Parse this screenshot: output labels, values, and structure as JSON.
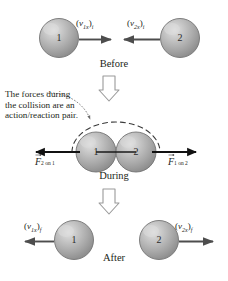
{
  "figure": {
    "panels": [
      {
        "key": "before",
        "label": "Before"
      },
      {
        "key": "during",
        "label": "During"
      },
      {
        "key": "after",
        "label": "After"
      }
    ]
  },
  "before": {
    "label": "Before",
    "ball_left": {
      "number": "1"
    },
    "ball_right": {
      "number": "2"
    },
    "velocity_left": {
      "open": "(",
      "v": "v",
      "sub": "1x",
      "close": ")",
      "outsub": "i",
      "direction": "right"
    },
    "velocity_right": {
      "open": "(",
      "v": "v",
      "sub": "2x",
      "close": ")",
      "outsub": "i",
      "direction": "left"
    }
  },
  "during": {
    "label": "During",
    "ball_left": {
      "number": "1"
    },
    "ball_right": {
      "number": "2"
    },
    "note": "The forces during the collision are an action/reaction pair.",
    "force_left": {
      "symbol": "F",
      "sub": "2 on 1",
      "direction": "left"
    },
    "force_right": {
      "symbol": "F",
      "sub": "1 on 2",
      "direction": "right"
    },
    "system_boundary": "dashed-arc"
  },
  "after": {
    "label": "After",
    "ball_left": {
      "number": "1"
    },
    "ball_right": {
      "number": "2"
    },
    "velocity_left": {
      "open": "(",
      "v": "v",
      "sub": "1x",
      "close": ")",
      "outsub": "f",
      "direction": "left"
    },
    "velocity_right": {
      "open": "(",
      "v": "v",
      "sub": "2x",
      "close": ")",
      "outsub": "f",
      "direction": "right"
    }
  },
  "flow": {
    "arrow_top": "down-arrow-before-to-during",
    "arrow_bottom": "down-arrow-during-to-after"
  },
  "colors": {
    "ball_fill": "#a9a9a9",
    "ball_highlight": "#d8d8d8",
    "ball_rim": "#6e6e6e",
    "ink": "#231f20",
    "arrow_outline": "#8a8a8a",
    "background": "#ffffff"
  }
}
